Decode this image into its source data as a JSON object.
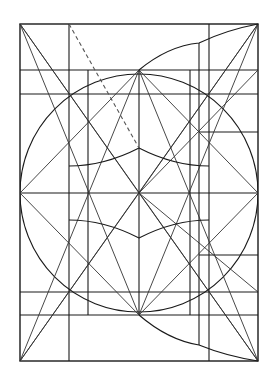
{
  "diagram": {
    "title": "",
    "stroke_color": "#1a1a1a",
    "background": "#ffffff",
    "frame": {
      "x1": 20,
      "y1": 24,
      "x2": 258,
      "y2": 361
    },
    "center": {
      "x": 139,
      "y": 193
    },
    "main_circle": {
      "cx": 139,
      "cy": 193,
      "r": 119
    },
    "horizontal_lines": [
      {
        "y": 70,
        "x1": 20,
        "x2": 258
      },
      {
        "y": 94,
        "x1": 20,
        "x2": 258
      },
      {
        "y": 132,
        "x1": 199,
        "x2": 258
      },
      {
        "y": 193,
        "x1": 20,
        "x2": 258
      },
      {
        "y": 255,
        "x1": 199,
        "x2": 258
      },
      {
        "y": 292,
        "x1": 20,
        "x2": 258
      },
      {
        "y": 315,
        "x1": 20,
        "x2": 258
      }
    ],
    "vertical_lines": [
      {
        "x": 69,
        "y1": 24,
        "y2": 361
      },
      {
        "x": 88,
        "y1": 70,
        "y2": 315
      },
      {
        "x": 139,
        "y1": 70,
        "y2": 315
      },
      {
        "x": 190,
        "y1": 70,
        "y2": 315
      },
      {
        "x": 199,
        "y1": 43,
        "y2": 345
      },
      {
        "x": 209,
        "y1": 24,
        "y2": 361
      }
    ],
    "diagonals": [
      {
        "x1": 20,
        "y1": 24,
        "x2": 258,
        "y2": 361
      },
      {
        "x1": 258,
        "y1": 24,
        "x2": 20,
        "y2": 361
      },
      {
        "x1": 20,
        "y1": 24,
        "x2": 139,
        "y2": 193
      },
      {
        "x1": 20,
        "y1": 193,
        "x2": 139,
        "y2": 70
      },
      {
        "x1": 139,
        "y1": 70,
        "x2": 258,
        "y2": 193
      },
      {
        "x1": 20,
        "y1": 193,
        "x2": 139,
        "y2": 315
      },
      {
        "x1": 139,
        "y1": 315,
        "x2": 258,
        "y2": 193
      },
      {
        "x1": 20,
        "y1": 361,
        "x2": 139,
        "y2": 193
      },
      {
        "x1": 258,
        "y1": 24,
        "x2": 139,
        "y2": 193
      },
      {
        "x1": 258,
        "y1": 361,
        "x2": 139,
        "y2": 193
      },
      {
        "x1": 258,
        "y1": 24,
        "x2": 139,
        "y2": 315
      },
      {
        "x1": 258,
        "y1": 70,
        "x2": 139,
        "y2": 193
      },
      {
        "x1": 20,
        "y1": 361,
        "x2": 139,
        "y2": 70
      },
      {
        "x1": 139,
        "y1": 70,
        "x2": 258,
        "y2": 361
      },
      {
        "x1": 20,
        "y1": 24,
        "x2": 139,
        "y2": 315
      },
      {
        "x1": 258,
        "y1": 292,
        "x2": 139,
        "y2": 193
      }
    ],
    "dashed_line": {
      "x1": 69,
      "y1": 24,
      "x2": 139,
      "y2": 148
    },
    "arcs": [
      {
        "name": "upper-bulge-arc",
        "d": "M139,70 Q168,46 199,43 Q226,30 258,24"
      },
      {
        "name": "lower-bulge-arc",
        "d": "M139,315 Q168,340 199,345 Q226,356 258,361"
      },
      {
        "name": "upper-inner-arc",
        "d": "M69,166 Q104,166 139,148 Q174,166 209,166"
      },
      {
        "name": "lower-inner-arc",
        "d": "M69,220 Q104,220 139,238 Q174,220 209,220"
      }
    ]
  }
}
